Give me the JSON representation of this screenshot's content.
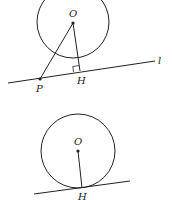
{
  "figures": [
    {
      "id": "distance-point-to-line",
      "labels": {
        "center": "O",
        "foot": "H",
        "point": "P",
        "line": "l"
      },
      "circle": {
        "cx": 73,
        "cy": 22,
        "r": 36
      },
      "line": {
        "x1": 8,
        "y1": 83,
        "x2": 155,
        "y2": 61
      },
      "points": {
        "O": [
          73,
          22
        ],
        "P": [
          40,
          79
        ],
        "H": [
          80,
          71
        ]
      }
    },
    {
      "id": "tangent-line",
      "labels": {
        "center": "O",
        "foot": "H"
      },
      "circle": {
        "cx": 78,
        "cy": 151,
        "r": 37
      },
      "line": {
        "x1": 34,
        "y1": 194,
        "x2": 130,
        "y2": 181
      },
      "points": {
        "O": [
          78,
          151
        ],
        "H": [
          82,
          188
        ]
      }
    }
  ],
  "colors": {
    "stroke": "#222222",
    "background": "#ffffff"
  }
}
